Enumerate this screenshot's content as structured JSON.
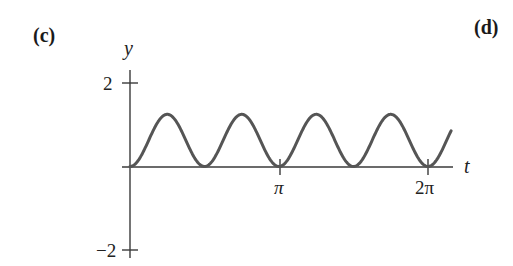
{
  "panels": {
    "left_label": "(c)",
    "right_label": "(d)"
  },
  "chart_data": {
    "type": "line",
    "title": "",
    "xlabel": "t",
    "ylabel": "y",
    "xlim": [
      0,
      6.77
    ],
    "ylim": [
      -2,
      2
    ],
    "x_ticks": [
      {
        "value": 3.14159,
        "label": "π"
      },
      {
        "value": 6.28319,
        "label": "2π"
      }
    ],
    "y_ticks": [
      {
        "value": 2,
        "label": "2"
      },
      {
        "value": -2,
        "label": "−2"
      }
    ],
    "grid": false,
    "legend": null,
    "series": [
      {
        "name": "y(t) ≈ 1.25·sin²(2t)",
        "description": "Non-negative periodic curve touching zero at multiples of π/2, peaks ≈1.25 at odd multiples of π/4; four full humps between 0 and 2π",
        "x": [
          0,
          0.3927,
          0.7854,
          1.1781,
          1.5708,
          1.9635,
          2.3562,
          2.7489,
          3.1416,
          3.5343,
          3.927,
          4.3197,
          4.7124,
          5.1051,
          5.4978,
          5.8905,
          6.2832,
          6.77
        ],
        "values": [
          0,
          0.625,
          1.25,
          0.625,
          0,
          0.625,
          1.25,
          0.625,
          0,
          0.625,
          1.25,
          0.625,
          0,
          0.625,
          1.25,
          0.625,
          0,
          0.86
        ]
      }
    ],
    "colors": {
      "curve": "#555555",
      "axes": "#3a3a3a"
    }
  }
}
